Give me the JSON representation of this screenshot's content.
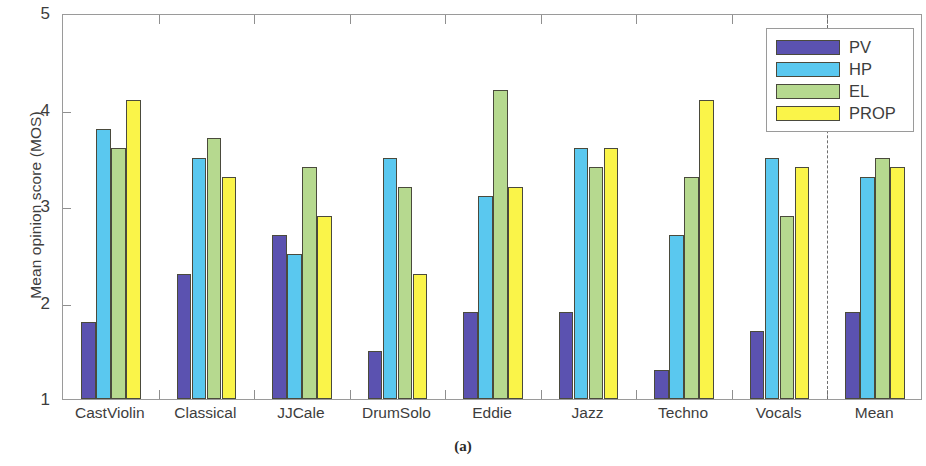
{
  "chart_data": {
    "type": "bar",
    "title": "",
    "subtitle": "",
    "xlabel": "",
    "ylabel": "Mean opinion score (MOS)",
    "ylim": [
      1,
      5
    ],
    "yticks": [
      1,
      2,
      3,
      4,
      5
    ],
    "grid": false,
    "legend_position": "top-right",
    "categories": [
      "CastViolin",
      "Classical",
      "JJCale",
      "DrumSolo",
      "Eddie",
      "Jazz",
      "Techno",
      "Vocals",
      "Mean"
    ],
    "series": [
      {
        "name": "PV",
        "color": "#5b52b0",
        "values": [
          1.8,
          2.3,
          2.7,
          1.5,
          1.9,
          1.9,
          1.3,
          1.7,
          1.9
        ]
      },
      {
        "name": "HP",
        "color": "#5ac8ef",
        "values": [
          3.8,
          3.5,
          2.5,
          3.5,
          3.1,
          3.6,
          2.7,
          3.5,
          3.3
        ]
      },
      {
        "name": "EL",
        "color": "#b6d98f",
        "values": [
          3.6,
          3.7,
          3.4,
          3.2,
          4.2,
          3.4,
          3.3,
          2.9,
          3.5
        ]
      },
      {
        "name": "PROP",
        "color": "#faf449",
        "values": [
          4.1,
          3.3,
          2.9,
          2.3,
          3.2,
          3.6,
          4.1,
          3.4,
          3.4
        ]
      }
    ],
    "annotations": [
      {
        "type": "vertical-dashed-line",
        "after_category": "Vocals",
        "label": "separator before Mean"
      }
    ]
  },
  "axis": {
    "y_tick_labels": [
      "1",
      "2",
      "3",
      "4",
      "5"
    ],
    "y_axis_title": "Mean opinion score (MOS)"
  },
  "legend": {
    "entries": [
      {
        "label": "PV",
        "color": "#5b52b0"
      },
      {
        "label": "HP",
        "color": "#5ac8ef"
      },
      {
        "label": "EL",
        "color": "#b6d98f"
      },
      {
        "label": "PROP",
        "color": "#faf449"
      }
    ]
  },
  "caption": {
    "text": "(a)"
  }
}
